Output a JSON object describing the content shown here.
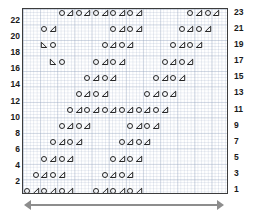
{
  "chart_data": {
    "type": "table",
    "title": "",
    "xlabel": "",
    "ylabel": "",
    "grid": true,
    "columns": 24,
    "rows": 23,
    "legend_position": "none",
    "symbols": {
      "circle": "O",
      "triangle_right": "right-leaning-triangle",
      "triangle_left": "left-leaning-triangle"
    },
    "left_axis_ticks": [
      22,
      20,
      18,
      16,
      14,
      12,
      10,
      8,
      6,
      4,
      2
    ],
    "right_axis_ticks": [
      23,
      21,
      19,
      17,
      15,
      13,
      11,
      9,
      7,
      5,
      3,
      1
    ],
    "row_data": [
      {
        "row": 23,
        "cells": [
          {
            "col": 4,
            "symbol": "circle"
          },
          {
            "col": 5,
            "symbol": "triangle_right"
          },
          {
            "col": 6,
            "symbol": "circle"
          },
          {
            "col": 7,
            "symbol": "triangle_right"
          },
          {
            "col": 8,
            "symbol": "circle"
          },
          {
            "col": 9,
            "symbol": "triangle_right"
          },
          {
            "col": 10,
            "symbol": "circle"
          },
          {
            "col": 11,
            "symbol": "triangle_right"
          },
          {
            "col": 12,
            "symbol": "circle"
          },
          {
            "col": 13,
            "symbol": "triangle_right"
          },
          {
            "col": 19,
            "symbol": "circle"
          },
          {
            "col": 20,
            "symbol": "triangle_right"
          },
          {
            "col": 21,
            "symbol": "circle"
          },
          {
            "col": 22,
            "symbol": "triangle_right"
          }
        ]
      },
      {
        "row": 21,
        "cells": [
          {
            "col": 2,
            "symbol": "circle"
          },
          {
            "col": 3,
            "symbol": "triangle_right"
          },
          {
            "col": 10,
            "symbol": "circle"
          },
          {
            "col": 11,
            "symbol": "triangle_right"
          },
          {
            "col": 12,
            "symbol": "circle"
          },
          {
            "col": 13,
            "symbol": "triangle_right"
          },
          {
            "col": 18,
            "symbol": "circle"
          },
          {
            "col": 19,
            "symbol": "triangle_right"
          },
          {
            "col": 20,
            "symbol": "circle"
          },
          {
            "col": 21,
            "symbol": "triangle_right"
          }
        ]
      },
      {
        "row": 19,
        "cells": [
          {
            "col": 2,
            "symbol": "triangle_left"
          },
          {
            "col": 3,
            "symbol": "circle"
          },
          {
            "col": 9,
            "symbol": "circle"
          },
          {
            "col": 10,
            "symbol": "triangle_right"
          },
          {
            "col": 11,
            "symbol": "circle"
          },
          {
            "col": 12,
            "symbol": "triangle_right"
          },
          {
            "col": 17,
            "symbol": "circle"
          },
          {
            "col": 18,
            "symbol": "triangle_right"
          },
          {
            "col": 19,
            "symbol": "circle"
          },
          {
            "col": 20,
            "symbol": "triangle_right"
          }
        ]
      },
      {
        "row": 17,
        "cells": [
          {
            "col": 3,
            "symbol": "triangle_left"
          },
          {
            "col": 4,
            "symbol": "circle"
          },
          {
            "col": 8,
            "symbol": "circle"
          },
          {
            "col": 9,
            "symbol": "triangle_right"
          },
          {
            "col": 10,
            "symbol": "circle"
          },
          {
            "col": 11,
            "symbol": "triangle_right"
          },
          {
            "col": 16,
            "symbol": "circle"
          },
          {
            "col": 17,
            "symbol": "triangle_right"
          },
          {
            "col": 18,
            "symbol": "circle"
          },
          {
            "col": 19,
            "symbol": "triangle_right"
          }
        ]
      },
      {
        "row": 15,
        "cells": [
          {
            "col": 7,
            "symbol": "circle"
          },
          {
            "col": 8,
            "symbol": "triangle_right"
          },
          {
            "col": 9,
            "symbol": "circle"
          },
          {
            "col": 10,
            "symbol": "triangle_right"
          },
          {
            "col": 15,
            "symbol": "circle"
          },
          {
            "col": 16,
            "symbol": "triangle_right"
          },
          {
            "col": 17,
            "symbol": "circle"
          },
          {
            "col": 18,
            "symbol": "triangle_right"
          }
        ]
      },
      {
        "row": 13,
        "cells": [
          {
            "col": 6,
            "symbol": "circle"
          },
          {
            "col": 7,
            "symbol": "triangle_right"
          },
          {
            "col": 8,
            "symbol": "circle"
          },
          {
            "col": 9,
            "symbol": "triangle_right"
          },
          {
            "col": 14,
            "symbol": "circle"
          },
          {
            "col": 15,
            "symbol": "triangle_right"
          },
          {
            "col": 16,
            "symbol": "circle"
          },
          {
            "col": 17,
            "symbol": "triangle_right"
          }
        ]
      },
      {
        "row": 11,
        "cells": [
          {
            "col": 5,
            "symbol": "circle"
          },
          {
            "col": 6,
            "symbol": "triangle_right"
          },
          {
            "col": 7,
            "symbol": "circle"
          },
          {
            "col": 8,
            "symbol": "triangle_right"
          },
          {
            "col": 9,
            "symbol": "circle"
          },
          {
            "col": 10,
            "symbol": "triangle_right"
          },
          {
            "col": 11,
            "symbol": "circle"
          },
          {
            "col": 12,
            "symbol": "triangle_right"
          },
          {
            "col": 13,
            "symbol": "circle"
          },
          {
            "col": 14,
            "symbol": "triangle_right"
          },
          {
            "col": 15,
            "symbol": "circle"
          },
          {
            "col": 16,
            "symbol": "triangle_right"
          }
        ]
      },
      {
        "row": 9,
        "cells": [
          {
            "col": 4,
            "symbol": "circle"
          },
          {
            "col": 5,
            "symbol": "triangle_right"
          },
          {
            "col": 6,
            "symbol": "circle"
          },
          {
            "col": 7,
            "symbol": "triangle_right"
          },
          {
            "col": 12,
            "symbol": "circle"
          },
          {
            "col": 13,
            "symbol": "triangle_right"
          },
          {
            "col": 14,
            "symbol": "circle"
          },
          {
            "col": 15,
            "symbol": "triangle_right"
          }
        ]
      },
      {
        "row": 7,
        "cells": [
          {
            "col": 3,
            "symbol": "circle"
          },
          {
            "col": 4,
            "symbol": "triangle_right"
          },
          {
            "col": 5,
            "symbol": "circle"
          },
          {
            "col": 6,
            "symbol": "triangle_right"
          },
          {
            "col": 11,
            "symbol": "circle"
          },
          {
            "col": 12,
            "symbol": "triangle_right"
          },
          {
            "col": 13,
            "symbol": "circle"
          },
          {
            "col": 14,
            "symbol": "triangle_right"
          }
        ]
      },
      {
        "row": 5,
        "cells": [
          {
            "col": 2,
            "symbol": "circle"
          },
          {
            "col": 3,
            "symbol": "triangle_right"
          },
          {
            "col": 4,
            "symbol": "circle"
          },
          {
            "col": 5,
            "symbol": "triangle_right"
          },
          {
            "col": 10,
            "symbol": "circle"
          },
          {
            "col": 11,
            "symbol": "triangle_right"
          },
          {
            "col": 12,
            "symbol": "circle"
          },
          {
            "col": 13,
            "symbol": "triangle_right"
          }
        ]
      },
      {
        "row": 3,
        "cells": [
          {
            "col": 1,
            "symbol": "circle"
          },
          {
            "col": 2,
            "symbol": "triangle_right"
          },
          {
            "col": 3,
            "symbol": "circle"
          },
          {
            "col": 4,
            "symbol": "triangle_right"
          },
          {
            "col": 9,
            "symbol": "circle"
          },
          {
            "col": 10,
            "symbol": "triangle_right"
          },
          {
            "col": 11,
            "symbol": "circle"
          },
          {
            "col": 12,
            "symbol": "triangle_right"
          }
        ]
      },
      {
        "row": 1,
        "cells": [
          {
            "col": 0,
            "symbol": "circle"
          },
          {
            "col": 1,
            "symbol": "triangle_right"
          },
          {
            "col": 2,
            "symbol": "circle"
          },
          {
            "col": 3,
            "symbol": "triangle_right"
          },
          {
            "col": 4,
            "symbol": "circle"
          },
          {
            "col": 5,
            "symbol": "triangle_right"
          },
          {
            "col": 8,
            "symbol": "circle"
          },
          {
            "col": 9,
            "symbol": "triangle_right"
          },
          {
            "col": 10,
            "symbol": "circle"
          },
          {
            "col": 11,
            "symbol": "triangle_right"
          },
          {
            "col": 12,
            "symbol": "circle"
          },
          {
            "col": 13,
            "symbol": "triangle_right"
          }
        ]
      }
    ]
  },
  "axes": {
    "left_label": "row-numbers-even",
    "right_label": "row-numbers-odd"
  },
  "footer": {
    "arrow": "width-arrow-double-headed"
  },
  "colors": {
    "symbol": "#1b1b1b",
    "frame": "#3c3c3c",
    "grid_major": "#96a5be",
    "grid_minor": "#788caf",
    "arrow": "#8d8d8d",
    "axis_text": "#1a1a1a"
  }
}
